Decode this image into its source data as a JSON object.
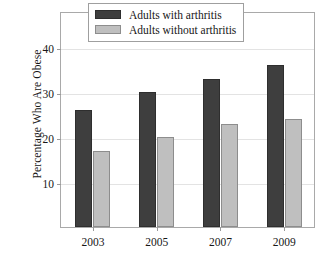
{
  "chart_data": {
    "type": "bar",
    "title": "",
    "subtitle": "",
    "xlabel": "",
    "ylabel": "Percentage Who Are Obese",
    "categories": [
      "2003",
      "2005",
      "2007",
      "2009"
    ],
    "series": [
      {
        "name": "Adults with arthritis",
        "values": [
          26,
          30,
          33,
          36
        ],
        "color": "#3e3e3e"
      },
      {
        "name": "Adults without arthritis",
        "values": [
          17,
          20,
          23,
          24
        ],
        "color": "#bfbfbf"
      }
    ],
    "ylim": [
      0,
      48
    ],
    "yticks": [
      10,
      20,
      30,
      40
    ],
    "ytick_labels": [
      "10",
      "20",
      "30",
      "40"
    ],
    "xtick_labels": [
      "2003",
      "2005",
      "2007",
      "2009"
    ],
    "grid": true,
    "grid_axis": "y",
    "legend_position": "top-right-inside"
  },
  "axes": {
    "y_title": "Percentage Who Are Obese",
    "y_tick_0": "10",
    "y_tick_1": "20",
    "y_tick_2": "30",
    "y_tick_3": "40",
    "x_tick_0": "2003",
    "x_tick_1": "2005",
    "x_tick_2": "2007",
    "x_tick_3": "2009"
  },
  "legend": {
    "items": [
      {
        "label": "Adults with arthritis",
        "color": "#3e3e3e"
      },
      {
        "label": "Adults without arthritis",
        "color": "#bfbfbf"
      }
    ]
  },
  "colors": {
    "dark_bar": "#3e3e3e",
    "light_bar": "#bfbfbf",
    "frame": "#a9a9a9",
    "gridline": "#e3e3e3",
    "background": "#ffffff",
    "text": "#171717"
  }
}
